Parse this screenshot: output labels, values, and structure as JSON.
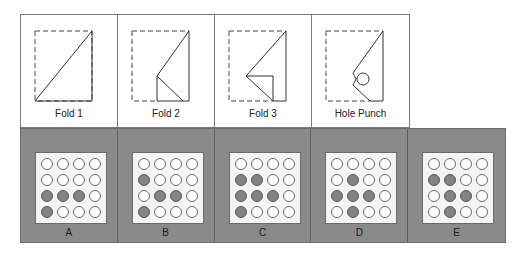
{
  "folds": [
    {
      "label": "Fold 1"
    },
    {
      "label": "Fold 2"
    },
    {
      "label": "Fold 3"
    },
    {
      "label": "Hole Punch"
    }
  ],
  "options": [
    {
      "label": "A",
      "grid": [
        [
          0,
          0,
          0,
          0
        ],
        [
          0,
          0,
          0,
          0
        ],
        [
          1,
          1,
          1,
          0
        ],
        [
          1,
          0,
          0,
          0
        ]
      ]
    },
    {
      "label": "B",
      "grid": [
        [
          0,
          0,
          0,
          0
        ],
        [
          1,
          0,
          0,
          0
        ],
        [
          0,
          1,
          1,
          0
        ],
        [
          1,
          0,
          0,
          0
        ]
      ]
    },
    {
      "label": "C",
      "grid": [
        [
          0,
          0,
          0,
          0
        ],
        [
          1,
          1,
          0,
          0
        ],
        [
          1,
          1,
          1,
          0
        ],
        [
          1,
          0,
          0,
          0
        ]
      ]
    },
    {
      "label": "D",
      "grid": [
        [
          0,
          0,
          0,
          0
        ],
        [
          0,
          1,
          0,
          0
        ],
        [
          1,
          1,
          1,
          0
        ],
        [
          0,
          1,
          0,
          0
        ]
      ]
    },
    {
      "label": "E",
      "grid": [
        [
          0,
          0,
          0,
          0
        ],
        [
          1,
          1,
          0,
          0
        ],
        [
          0,
          1,
          1,
          0
        ],
        [
          0,
          1,
          0,
          0
        ]
      ]
    }
  ],
  "colors": {
    "panel_bg": "#8a8a8a",
    "filled_hole": "#848484",
    "border": "#7a7a7a"
  }
}
